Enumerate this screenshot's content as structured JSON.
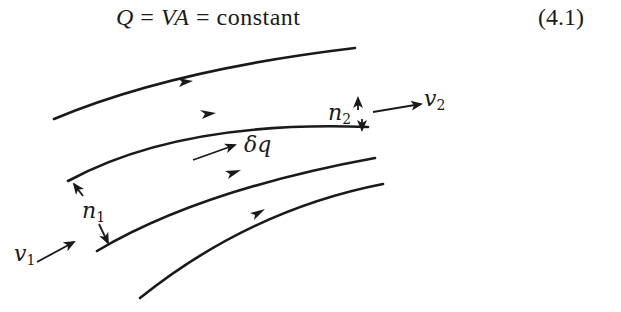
{
  "equation": {
    "lhs": "Q",
    "eq1": " = ",
    "mid": "VA",
    "eq2": " = ",
    "rhs": "constant",
    "number": "(4.1)"
  },
  "diagram": {
    "type": "streamtube flow sketch",
    "labels": {
      "v1": "v",
      "v1_sub": "1",
      "v2": "v",
      "v2_sub": "2",
      "n1": "n",
      "n1_sub": "1",
      "n2": "n",
      "n2_sub": "2",
      "dq": "δq"
    },
    "streamline_count": 4,
    "colors": {
      "ink": "#1a1a1a",
      "background": "#ffffff"
    }
  }
}
